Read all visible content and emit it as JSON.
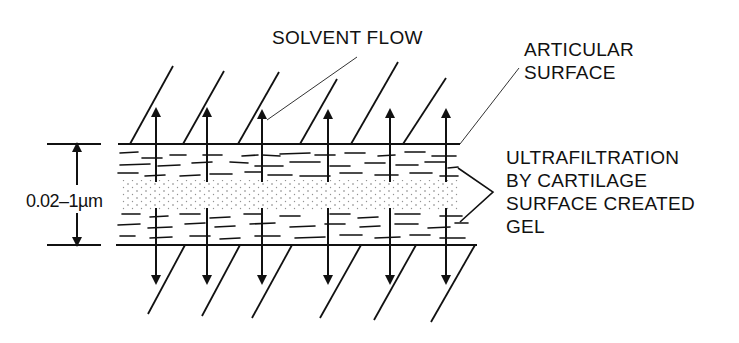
{
  "diagram": {
    "labels": {
      "solvent_flow": "SOLVENT FLOW",
      "articular_surface": [
        "ARTICULAR",
        "SURFACE"
      ],
      "ultrafiltration": [
        "ULTRAFILTRATION",
        "BY CARTILAGE",
        "SURFACE CREATED",
        "GEL"
      ],
      "gap_dimension": "0.02–1µm"
    },
    "colors": {
      "ink": "#111111",
      "background": "#ffffff"
    },
    "geometry": {
      "top_surface_y": 144,
      "bottom_surface_y": 245,
      "arrow_x": [
        156,
        207,
        262,
        328,
        390,
        446
      ],
      "components": [
        "upper cartilage surface",
        "lower cartilage surface",
        "gel layers (dashed)",
        "dotted fluid film",
        "bidirectional solvent flow arrows",
        "dimension marker"
      ]
    }
  }
}
